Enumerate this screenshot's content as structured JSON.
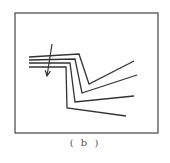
{
  "figure": {
    "caption": "( b )",
    "frame": {
      "x": 15,
      "y": 13,
      "width": 143,
      "height": 120,
      "stroke": "#444444"
    },
    "line_color": "#333333",
    "layers": [
      {
        "name": "layer-1",
        "points": "29,57 79,54 89,84 134,61"
      },
      {
        "name": "layer-2",
        "points": "29,60 75,59 82,93 137,75"
      },
      {
        "name": "layer-3",
        "points": "29,63 70,63 75,102 134,96"
      },
      {
        "name": "layer-4",
        "points": "29,67 66,67 67,108 126,116"
      }
    ],
    "arrow": {
      "x1": 52,
      "y1": 44,
      "x2": 47,
      "y2": 76
    }
  }
}
